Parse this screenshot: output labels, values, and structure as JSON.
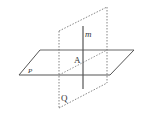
{
  "diagram": {
    "type": "geometry-planes",
    "labels": {
      "line_m": "m",
      "point_A": "A",
      "plane_P": "P",
      "plane_Q": "Q"
    },
    "colors": {
      "stroke": "#555555",
      "dashed": "#777777",
      "background": "#ffffff"
    }
  }
}
